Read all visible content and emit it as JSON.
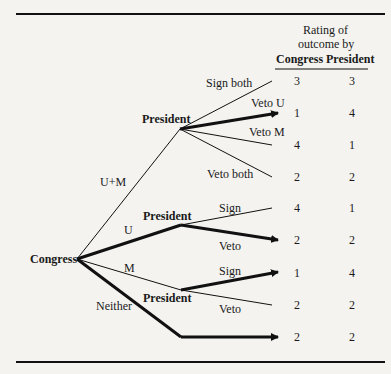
{
  "header": {
    "line1": "Rating of",
    "line2": "outcome by",
    "col_congress": "Congress",
    "col_president": "President"
  },
  "nodes": {
    "root": "Congress",
    "p1": "President",
    "p2": "President",
    "p3": "President"
  },
  "congress_moves": {
    "um": "U+M",
    "u": "U",
    "m": "M",
    "neither": "Neither"
  },
  "president_moves": {
    "sign_both": "Sign both",
    "veto_u": "Veto U",
    "veto_m": "Veto M",
    "veto_both": "Veto both",
    "p2_sign": "Sign",
    "p2_veto": "Veto",
    "p3_sign": "Sign",
    "p3_veto": "Veto"
  },
  "outcomes": [
    {
      "congress": "3",
      "president": "3"
    },
    {
      "congress": "1",
      "president": "4"
    },
    {
      "congress": "4",
      "president": "1"
    },
    {
      "congress": "2",
      "president": "2"
    },
    {
      "congress": "4",
      "president": "1"
    },
    {
      "congress": "2",
      "president": "2"
    },
    {
      "congress": "1",
      "president": "4"
    },
    {
      "congress": "2",
      "president": "2"
    },
    {
      "congress": "2",
      "president": "2"
    }
  ]
}
